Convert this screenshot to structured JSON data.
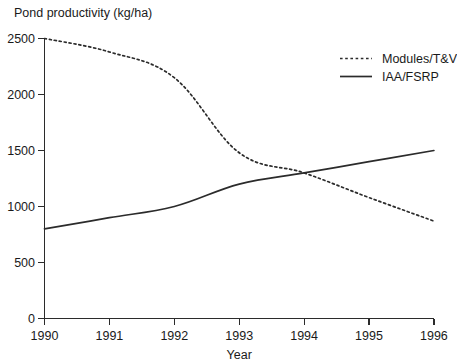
{
  "chart_data": {
    "type": "line",
    "title": "",
    "ylabel": "Pond productivity (kg/ha)",
    "xlabel": "Year",
    "x": [
      1990,
      1991,
      1992,
      1993,
      1994,
      1995,
      1996
    ],
    "categories": [
      "1990",
      "1991",
      "1992",
      "1993",
      "1994",
      "1995",
      "1996"
    ],
    "xlim": [
      1990,
      1996
    ],
    "ylim": [
      0,
      2500
    ],
    "yticks": [
      0,
      500,
      1000,
      1500,
      2000,
      2500
    ],
    "ytick_labels": [
      "0",
      "500",
      "1000",
      "1500",
      "2000",
      "2500"
    ],
    "grid": false,
    "legend_position": "top-right",
    "series": [
      {
        "name": "Modules/T&V",
        "style": "dotted",
        "color": "#2b2b2b",
        "values": [
          2500,
          2380,
          2150,
          1480,
          1300,
          1080,
          870
        ]
      },
      {
        "name": "IAA/FSRP",
        "style": "solid",
        "color": "#2b2b2b",
        "values": [
          800,
          900,
          1000,
          1200,
          1300,
          1400,
          1500
        ]
      }
    ],
    "annotations": []
  },
  "legend": {
    "items": [
      {
        "label": "Modules/T&V"
      },
      {
        "label": "IAA/FSRP"
      }
    ]
  },
  "colors": {
    "ink": "#2b2b2b",
    "background": "#ffffff"
  }
}
